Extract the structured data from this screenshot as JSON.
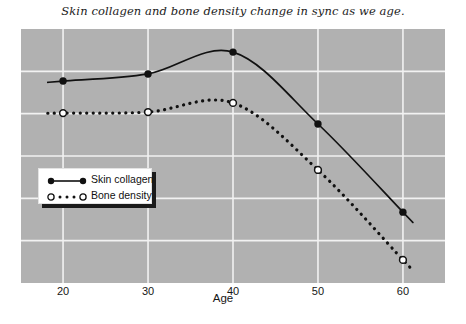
{
  "chart_data": {
    "type": "line",
    "title": "Skin collagen and bone density change in sync as we age.",
    "xlabel": "Age",
    "ylabel": "",
    "x": [
      20,
      30,
      40,
      50,
      60
    ],
    "xtick_labels": [
      "20",
      "30",
      "40",
      "50",
      "60"
    ],
    "xlim": [
      15.05,
      64.95
    ],
    "ylim": [
      0,
      100
    ],
    "grid": true,
    "legend_position": "lower-left-inside",
    "series": [
      {
        "name": "Skin collagen",
        "marker": "filled-circle",
        "line_style": "solid",
        "color": "#111111",
        "values": [
          79.5,
          82.3,
          90.9,
          62.6,
          27.9
        ]
      },
      {
        "name": "Bone density",
        "marker": "open-circle",
        "line_style": "dotted",
        "color": "#111111",
        "values": [
          66.9,
          67.3,
          70.9,
          44.5,
          9.1
        ]
      }
    ]
  },
  "axis": {
    "x_title": "Age"
  },
  "legend": {
    "entries": [
      {
        "label": "Skin collagen",
        "key": "solid-filled-circle"
      },
      {
        "label": "Bone density",
        "key": "dotted-open-circle"
      }
    ]
  },
  "style": {
    "plot_background": "#b1b1b1",
    "gridline_color": "#f2f2f2",
    "page_background": "#ffffff",
    "ink": "#111111"
  }
}
